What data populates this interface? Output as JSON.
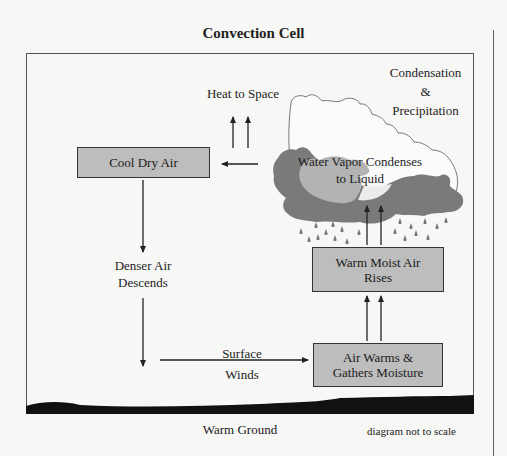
{
  "title": "Convection Cell",
  "boxes": {
    "cool_dry_air": "Cool Dry Air",
    "warm_moist_air_line1": "Warm Moist Air",
    "warm_moist_air_line2": "Rises",
    "air_warms_line1": "Air Warms &",
    "air_warms_line2": "Gathers Moisture"
  },
  "labels": {
    "heat_to_space": "Heat to Space",
    "condensation_line1": "Condensation",
    "condensation_line2": "&",
    "condensation_line3": "Precipitation",
    "water_vapor_line1": "Water Vapor Condenses",
    "water_vapor_line2": "to Liquid",
    "denser_air_line1": "Denser Air",
    "denser_air_line2": "Descends",
    "surface_winds_line1": "Surface",
    "surface_winds_line2": "Winds",
    "warm_ground": "Warm Ground",
    "not_to_scale": "diagram not to scale"
  },
  "colors": {
    "box_fill": "#bdbdbd",
    "cloud_dark": "#7a7a7a",
    "cloud_light": "#b3b3b3",
    "ground": "#111111",
    "background": "#f7f7f6"
  }
}
